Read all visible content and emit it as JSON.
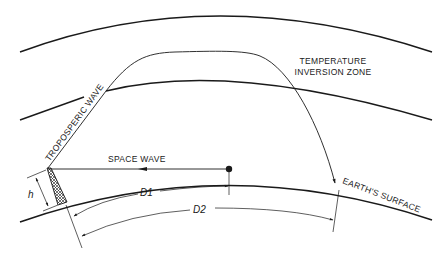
{
  "diagram": {
    "labels": {
      "temperature_line1": "TEMPERATURE",
      "temperature_line2": "INVERSION ZONE",
      "tropospheric_wave": "TROPOSPERIC WAVE",
      "space_wave": "SPACE WAVE",
      "earths_surface": "EARTH'S SURFACE",
      "h": "h",
      "d1": "D1",
      "d2": "D2"
    },
    "elements": [
      {
        "id": "outer-atmosphere-arc",
        "type": "curve"
      },
      {
        "id": "inversion-layer-arc",
        "type": "curve"
      },
      {
        "id": "earth-surface-arc",
        "type": "curve"
      },
      {
        "id": "antenna-tower",
        "type": "icon"
      },
      {
        "id": "tropospheric-wave-path",
        "type": "curve-arrow"
      },
      {
        "id": "space-wave-path",
        "type": "line-arrow"
      },
      {
        "id": "receiver-point",
        "type": "dot"
      },
      {
        "id": "height-dimension",
        "type": "dimension"
      },
      {
        "id": "d1-dimension",
        "type": "dimension"
      },
      {
        "id": "d2-dimension",
        "type": "dimension"
      }
    ],
    "colors": {
      "ink": "#1a1a1a",
      "background": "#ffffff"
    }
  }
}
